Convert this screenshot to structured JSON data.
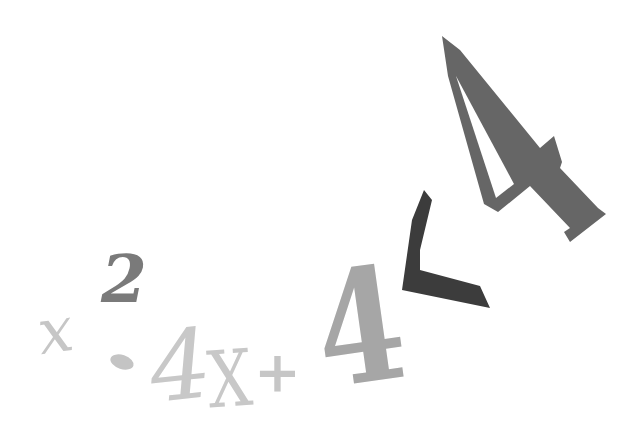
{
  "illustration": {
    "expression": "x² - 4x + 4 < 4",
    "glyphs": [
      {
        "id": "x",
        "text": "x",
        "color": "#c6c6c6"
      },
      {
        "id": "exp",
        "text": "2",
        "color": "#7a7a7a"
      },
      {
        "id": "minus",
        "text": "-",
        "color": "#c4c4c4"
      },
      {
        "id": "four1",
        "text": "4",
        "color": "#c8c8c8"
      },
      {
        "id": "x2",
        "text": "X",
        "color": "#c8c8c8"
      },
      {
        "id": "plus",
        "text": "+",
        "color": "#c6c6c6"
      },
      {
        "id": "four2",
        "text": "4",
        "color": "#a6a6a6"
      },
      {
        "id": "lt",
        "text": "<",
        "color": "#3c3c3c"
      },
      {
        "id": "four3",
        "text": "4",
        "color": "#686868"
      }
    ]
  }
}
